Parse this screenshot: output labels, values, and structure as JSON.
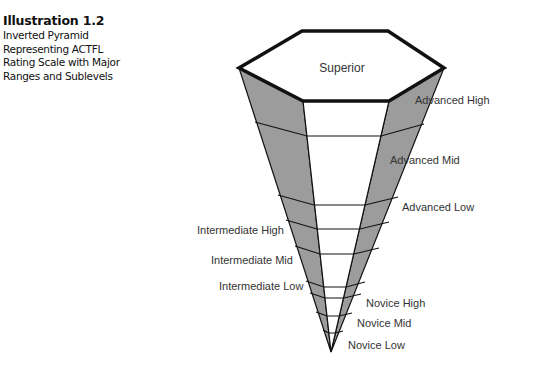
{
  "caption": {
    "title": "Illustration 1.2",
    "lines": [
      "Inverted Pyramid",
      "Representing ACTFL",
      "Rating Scale with Major",
      "Ranges and Sublevels"
    ]
  },
  "diagram": {
    "top_label": "Superior",
    "colors": {
      "side_fill": "#9c9c9c",
      "stroke": "#111111",
      "face_fill": "#ffffff",
      "text": "#333333"
    },
    "right_labels": [
      {
        "text": "Advanced High",
        "x": 415,
        "y": 104
      },
      {
        "text": "Advanced Mid",
        "x": 390,
        "y": 163
      },
      {
        "text": "Advanced Low",
        "x": 402,
        "y": 210
      },
      {
        "text": "Novice High",
        "x": 366,
        "y": 306
      },
      {
        "text": "Novice Mid",
        "x": 357,
        "y": 326
      },
      {
        "text": "Novice Low",
        "x": 348,
        "y": 348
      }
    ],
    "left_labels": [
      {
        "text": "Intermediate High",
        "x": 197,
        "y": 234
      },
      {
        "text": "Intermediate Mid",
        "x": 211,
        "y": 264
      },
      {
        "text": "Intermediate Low",
        "x": 219,
        "y": 290
      }
    ]
  }
}
